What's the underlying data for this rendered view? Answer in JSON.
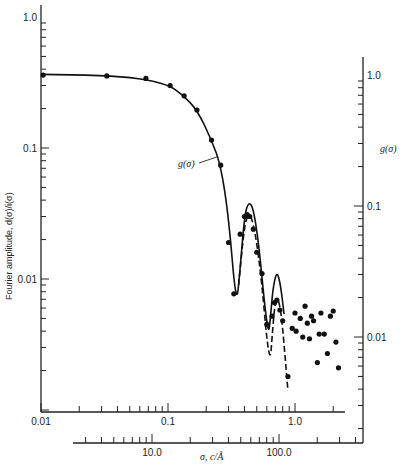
{
  "chart_data": {
    "type": "scatter",
    "title": "",
    "xlabel": "σ, c/Å",
    "ylabel": "Fourier amplitude, d(σ)/i(σ)",
    "y2label": "g(σ)",
    "x_scale": "log",
    "y_scale": "log",
    "xlim": [
      0.01,
      3.0
    ],
    "ylim": [
      0.0015,
      1.2
    ],
    "grid": false,
    "x_ticks": [
      {
        "value": 0.01,
        "label": "0.01"
      },
      {
        "value": 0.1,
        "label": "0.1"
      },
      {
        "value": 1.0,
        "label": "1.0"
      }
    ],
    "y_ticks": [
      {
        "value": 1.0,
        "label": "1.0"
      },
      {
        "value": 0.1,
        "label": "0.1"
      },
      {
        "value": 0.01,
        "label": "0.01"
      }
    ],
    "x2_axis": {
      "label": "σ, c/Å",
      "ticks": [
        {
          "value": 10.0,
          "label": "10.0"
        },
        {
          "value": 100.0,
          "label": "100.0"
        }
      ]
    },
    "y2_axis": {
      "label": "g(σ)",
      "ticks": [
        {
          "value": 1.0,
          "label": "1.0"
        },
        {
          "value": 0.1,
          "label": "0.1"
        },
        {
          "value": 0.01,
          "label": "0.01"
        }
      ]
    },
    "annotations": [
      {
        "text": "g(σ)",
        "arrow_to": {
          "x": 0.255,
          "y": 0.08
        }
      }
    ],
    "series": [
      {
        "name": "measured d(σ)/i(σ)",
        "style": "points",
        "x": [
          0.0104,
          0.033,
          0.067,
          0.104,
          0.134,
          0.169,
          0.22,
          0.26,
          0.3,
          0.33,
          0.37,
          0.4,
          0.42,
          0.44,
          0.47,
          0.5,
          0.55,
          0.6,
          0.66,
          0.69,
          0.72,
          0.76,
          0.8,
          0.88,
          0.95,
          1.0,
          1.02,
          1.1,
          1.15,
          1.2,
          1.25,
          1.3,
          1.35,
          1.4,
          1.5,
          1.55,
          1.6,
          1.7,
          1.8,
          1.9,
          2.0,
          2.1,
          2.2
        ],
        "y": [
          0.36,
          0.355,
          0.34,
          0.3,
          0.25,
          0.195,
          0.115,
          0.074,
          0.019,
          0.0077,
          0.022,
          0.03,
          0.031,
          0.03,
          0.024,
          0.016,
          0.011,
          0.0045,
          0.0052,
          0.0066,
          0.0069,
          0.0058,
          0.0048,
          0.0018,
          0.0042,
          0.0055,
          0.004,
          0.005,
          0.0036,
          0.0062,
          0.0046,
          0.0035,
          0.0052,
          0.0048,
          0.0023,
          0.0038,
          0.0055,
          0.0038,
          0.0027,
          0.0052,
          0.0057,
          0.0033,
          0.0021
        ]
      },
      {
        "name": "g(σ) theoretical (solid)",
        "style": "solid-line",
        "x": [
          0.01,
          0.03,
          0.06,
          0.1,
          0.13,
          0.17,
          0.22,
          0.26,
          0.3,
          0.345,
          0.37,
          0.4,
          0.43,
          0.47,
          0.52,
          0.58,
          0.62,
          0.64,
          0.67,
          0.72,
          0.77,
          0.82
        ],
        "y": [
          0.365,
          0.358,
          0.34,
          0.305,
          0.255,
          0.195,
          0.115,
          0.074,
          0.03,
          0.006,
          0.012,
          0.03,
          0.039,
          0.035,
          0.018,
          0.006,
          0.0038,
          0.005,
          0.0085,
          0.0116,
          0.009,
          0.0054
        ]
      },
      {
        "name": "fit (dashed)",
        "style": "dashed-line",
        "x": [
          0.36,
          0.4,
          0.43,
          0.46,
          0.5,
          0.55,
          0.6,
          0.64,
          0.66,
          0.69,
          0.72,
          0.76,
          0.8,
          0.84,
          0.88
        ],
        "y": [
          0.009,
          0.026,
          0.031,
          0.029,
          0.019,
          0.009,
          0.0034,
          0.0024,
          0.0036,
          0.0061,
          0.0072,
          0.0064,
          0.0042,
          0.0024,
          0.0014
        ]
      }
    ]
  }
}
